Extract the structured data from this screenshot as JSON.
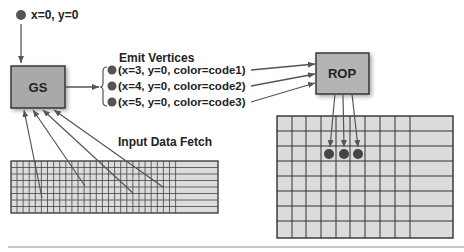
{
  "diagram": {
    "input_vertex": {
      "label": "x=0, y=0"
    },
    "gs_box": {
      "label": "GS"
    },
    "emit_vertices": {
      "title": "Emit Vertices",
      "items": [
        {
          "label": "(x=3, y=0, color=code1)"
        },
        {
          "label": "(x=4, y=0, color=code2)"
        },
        {
          "label": "(x=5, y=0, color=code3)"
        }
      ]
    },
    "rop_box": {
      "label": "ROP"
    },
    "input_fetch": {
      "label": "Input Data Fetch"
    }
  },
  "colors": {
    "box_fill": "#a9a9a9",
    "box_stroke": "#222222",
    "grid_fill": "#d9d9d9",
    "grid_line": "#333333",
    "dot": "#555555",
    "arrow": "#555555",
    "rule": "#c8c8c8"
  }
}
